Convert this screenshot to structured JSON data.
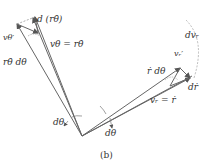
{
  "figure": {
    "caption": "(b)",
    "colors": {
      "line": "#666666",
      "dashed": "#aaaaaa",
      "text": "#333333"
    }
  },
  "labels": {
    "d_r_thetadot": "d (rθ̇)",
    "v_theta_prime": "vθ′",
    "v_theta_eq": "vθ = rθ̇",
    "r_thetadot_dtheta": "rθ̇ dθ",
    "d_v_r": "dvᵣ",
    "v_r_prime": "vᵣ′",
    "rdot_dtheta": "ṙ dθ",
    "d_rdot": "dṙ",
    "v_r_eq": "vᵣ = ṙ",
    "dtheta_left": "dθ",
    "dtheta_right": "dθ"
  }
}
